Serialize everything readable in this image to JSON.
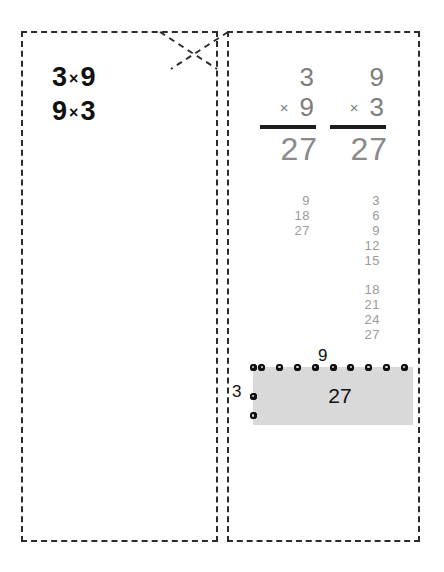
{
  "worksheet": {
    "kind": "multiplication-flashcard",
    "cut_lines_color": "#2b2b2b",
    "background": "#ffffff"
  },
  "front": {
    "name": "flashcard-front",
    "expressions": [
      {
        "a": "3",
        "op": "×",
        "b": "9"
      },
      {
        "a": "9",
        "op": "×",
        "b": "3"
      }
    ]
  },
  "back": {
    "name": "flashcard-back",
    "vertical_problems": [
      {
        "label": "3-times-9",
        "multiplicand": "3",
        "operator": "×",
        "multiplier": "9",
        "product": "27"
      },
      {
        "label": "9-times-3",
        "multiplicand": "9",
        "operator": "×",
        "multiplier": "3",
        "product": "27"
      }
    ],
    "skip_counts": [
      {
        "label": "count-by-9",
        "before_gap": [
          "9",
          "18",
          "27"
        ],
        "after_gap": []
      },
      {
        "label": "count-by-3",
        "before_gap": [
          "3",
          "6",
          "9",
          "12",
          "15"
        ],
        "after_gap": [
          "18",
          "21",
          "24",
          "27"
        ]
      }
    ],
    "array": {
      "label": "area-model-3-by-9",
      "columns": 9,
      "rows": 3,
      "column_label": "9",
      "row_label": "3",
      "total": "27",
      "fill_color": "#d9d9d9",
      "dot_color": "#111111"
    }
  }
}
